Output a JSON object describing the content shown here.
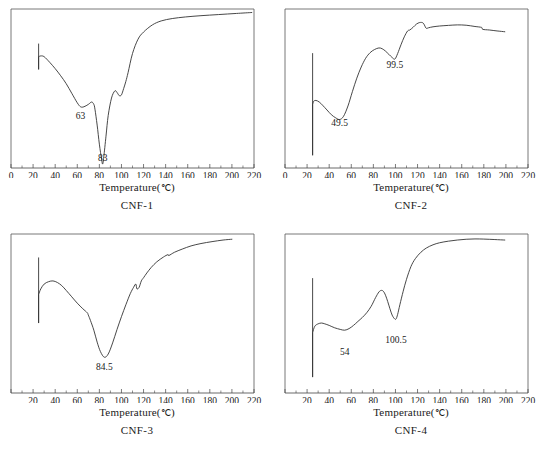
{
  "figure": {
    "type": "multi-panel-line-chart",
    "panel_count": 4
  },
  "axis_label": "Temperature(",
  "axis_unit": "℃",
  "axis_label_end": ")",
  "panels": [
    {
      "caption": "CNF-1",
      "xlabel": "Temperature(℃)",
      "show_zero_tick": true,
      "ticks": [
        "0",
        "20",
        "40",
        "60",
        "80",
        "100",
        "120",
        "140",
        "160",
        "180",
        "200",
        "220"
      ],
      "annotations": [
        {
          "text": "63",
          "x": 63,
          "y": 0.3
        },
        {
          "text": "83",
          "x": 83,
          "y": 0.04
        }
      ]
    },
    {
      "caption": "CNF-2",
      "xlabel": "Temperature(℃)",
      "show_zero_tick": true,
      "ticks": [
        "0",
        "20",
        "40",
        "60",
        "80",
        "100",
        "120",
        "140",
        "160",
        "180",
        "200",
        "220"
      ],
      "annotations": [
        {
          "text": "49.5",
          "x": 49.5,
          "y": 0.26
        },
        {
          "text": "99.5",
          "x": 99.5,
          "y": 0.62
        }
      ]
    },
    {
      "caption": "CNF-3",
      "xlabel": "Temperature(℃)",
      "show_zero_tick": false,
      "ticks": [
        "20",
        "40",
        "60",
        "80",
        "100",
        "120",
        "140",
        "160",
        "180",
        "200",
        "220"
      ],
      "annotations": [
        {
          "text": "84.5",
          "x": 84.5,
          "y": 0.14
        }
      ]
    },
    {
      "caption": "CNF-4",
      "xlabel": "Temperature(℃)",
      "show_zero_tick": false,
      "ticks": [
        "20",
        "40",
        "60",
        "80",
        "100",
        "120",
        "140",
        "160",
        "180",
        "200",
        "220"
      ],
      "annotations": [
        {
          "text": "54",
          "x": 54,
          "y": 0.23
        },
        {
          "text": "100.5",
          "x": 100.5,
          "y": 0.31
        }
      ]
    }
  ],
  "chart_data": {
    "type": "line",
    "title": "",
    "xlabel": "Temperature(℃)",
    "ylabel": "",
    "xlim": [
      0,
      220
    ],
    "ylim": [
      0,
      1
    ],
    "xticks": [
      0,
      20,
      40,
      60,
      80,
      100,
      120,
      140,
      160,
      180,
      200,
      220
    ],
    "grid": false,
    "legend": "none",
    "note": "Four DSC thermograms; y-axis is heat flow in arbitrary units (unlabelled). Values below are normalized 0-1 within each panel frame.",
    "series": [
      {
        "name": "CNF-1",
        "endotherm_peaks_c": [
          63,
          83
        ],
        "x": [
          25,
          25,
          25,
          27,
          30,
          35,
          40,
          45,
          50,
          55,
          60,
          63,
          66,
          70,
          73,
          75,
          76,
          78,
          80,
          82,
          83,
          84,
          86,
          88,
          91,
          94,
          96,
          98,
          100,
          102,
          104,
          106,
          110,
          115,
          120,
          128,
          136,
          146,
          158,
          172,
          188,
          204,
          218
        ],
        "y": [
          0.78,
          0.62,
          0.7,
          0.705,
          0.7,
          0.665,
          0.625,
          0.58,
          0.53,
          0.47,
          0.41,
          0.385,
          0.385,
          0.4,
          0.415,
          0.4,
          0.37,
          0.27,
          0.15,
          0.055,
          0.025,
          0.07,
          0.2,
          0.33,
          0.44,
          0.485,
          0.475,
          0.455,
          0.46,
          0.5,
          0.545,
          0.6,
          0.72,
          0.81,
          0.855,
          0.9,
          0.925,
          0.94,
          0.95,
          0.958,
          0.965,
          0.972,
          0.978
        ]
      },
      {
        "name": "CNF-2",
        "endotherm_peaks_c": [
          49.5,
          99.5
        ],
        "x": [
          25,
          25,
          25,
          26,
          28,
          31,
          34,
          38,
          42,
          46,
          49.5,
          53,
          57,
          61,
          65,
          69,
          73,
          77,
          81,
          85,
          88,
          91,
          94,
          97,
          99.5,
          102,
          105,
          108,
          111,
          113,
          116,
          119,
          122,
          125,
          127,
          128,
          130,
          134,
          140,
          148,
          156,
          164,
          172,
          178,
          179,
          185,
          192,
          199
        ],
        "y": [
          0.72,
          0.08,
          0.4,
          0.42,
          0.425,
          0.415,
          0.395,
          0.365,
          0.335,
          0.315,
          0.305,
          0.325,
          0.39,
          0.48,
          0.565,
          0.635,
          0.69,
          0.725,
          0.745,
          0.755,
          0.75,
          0.735,
          0.715,
          0.695,
          0.685,
          0.72,
          0.775,
          0.825,
          0.862,
          0.868,
          0.885,
          0.905,
          0.915,
          0.912,
          0.888,
          0.878,
          0.882,
          0.888,
          0.893,
          0.897,
          0.9,
          0.898,
          0.89,
          0.884,
          0.872,
          0.868,
          0.862,
          0.857
        ]
      },
      {
        "name": "CNF-3",
        "endotherm_peaks_c": [
          84.5
        ],
        "x": [
          25,
          25,
          25,
          27,
          30,
          34,
          38,
          42,
          46,
          50,
          55,
          60,
          65,
          69,
          70,
          72,
          75,
          78,
          81,
          84.5,
          88,
          92,
          96,
          100,
          104,
          108,
          111,
          113,
          114,
          116,
          118,
          120,
          123,
          127,
          132,
          138,
          142,
          143,
          148,
          155,
          163,
          172,
          182,
          192,
          200
        ],
        "y": [
          0.85,
          0.44,
          0.62,
          0.655,
          0.685,
          0.7,
          0.705,
          0.695,
          0.675,
          0.645,
          0.605,
          0.565,
          0.53,
          0.505,
          0.49,
          0.455,
          0.395,
          0.32,
          0.26,
          0.225,
          0.245,
          0.315,
          0.4,
          0.48,
          0.555,
          0.625,
          0.665,
          0.685,
          0.655,
          0.665,
          0.705,
          0.725,
          0.755,
          0.79,
          0.825,
          0.855,
          0.87,
          0.865,
          0.885,
          0.905,
          0.925,
          0.94,
          0.952,
          0.962,
          0.967
        ]
      },
      {
        "name": "CNF-4",
        "endotherm_peaks_c": [
          54,
          100.5
        ],
        "x": [
          25,
          25,
          25,
          27,
          30,
          33,
          36,
          40,
          45,
          50,
          54,
          58,
          62,
          66,
          70,
          74,
          78,
          82,
          85,
          87,
          89,
          91,
          93,
          95,
          97,
          99,
          100.5,
          102,
          104,
          107,
          110,
          114,
          118,
          123,
          128,
          134,
          140,
          148,
          156,
          164,
          172,
          180,
          190,
          199
        ],
        "y": [
          0.72,
          0.1,
          0.38,
          0.42,
          0.435,
          0.44,
          0.435,
          0.425,
          0.41,
          0.4,
          0.395,
          0.405,
          0.425,
          0.45,
          0.475,
          0.505,
          0.545,
          0.6,
          0.635,
          0.645,
          0.64,
          0.615,
          0.575,
          0.53,
          0.49,
          0.468,
          0.465,
          0.495,
          0.555,
          0.64,
          0.715,
          0.795,
          0.845,
          0.885,
          0.912,
          0.932,
          0.945,
          0.955,
          0.962,
          0.967,
          0.969,
          0.968,
          0.965,
          0.962
        ]
      }
    ]
  }
}
